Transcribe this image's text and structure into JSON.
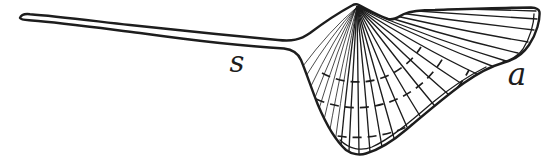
{
  "figure": {
    "labels": {
      "spine": "s",
      "aperture": "a"
    }
  },
  "colors": {
    "ink": "#1d1d1d",
    "background": "#ffffff"
  }
}
